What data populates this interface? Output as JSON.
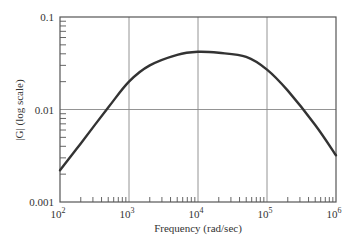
{
  "chart_data": {
    "type": "line",
    "title": "",
    "xlabel": "Frequency (rad/sec)",
    "ylabel": "|G| (log scale)",
    "xscale": "log",
    "yscale": "log",
    "xlim": [
      100,
      1000000
    ],
    "ylim": [
      0.001,
      0.1
    ],
    "grid": true,
    "legend": null,
    "x_tick_labels": [
      {
        "base": "10",
        "exp": "2",
        "value": 100
      },
      {
        "base": "10",
        "exp": "3",
        "value": 1000
      },
      {
        "base": "10",
        "exp": "4",
        "value": 10000
      },
      {
        "base": "10",
        "exp": "5",
        "value": 100000
      },
      {
        "base": "10",
        "exp": "6",
        "value": 1000000
      }
    ],
    "y_tick_labels": [
      {
        "label": "0.1",
        "value": 0.1
      },
      {
        "label": "0.01",
        "value": 0.01
      },
      {
        "label": "0.001",
        "value": 0.001
      }
    ],
    "series": [
      {
        "name": "|G|",
        "color": "#333333",
        "x": [
          100,
          200,
          500,
          1000,
          2000,
          5000,
          10000,
          20000,
          50000,
          100000,
          200000,
          500000,
          1000000
        ],
        "y": [
          0.0022,
          0.0043,
          0.0105,
          0.02,
          0.03,
          0.039,
          0.042,
          0.041,
          0.037,
          0.027,
          0.016,
          0.0068,
          0.0032
        ]
      }
    ]
  },
  "colors": {
    "axis": "#555555",
    "grid": "#888888",
    "curve": "#333333",
    "text": "#333333"
  }
}
